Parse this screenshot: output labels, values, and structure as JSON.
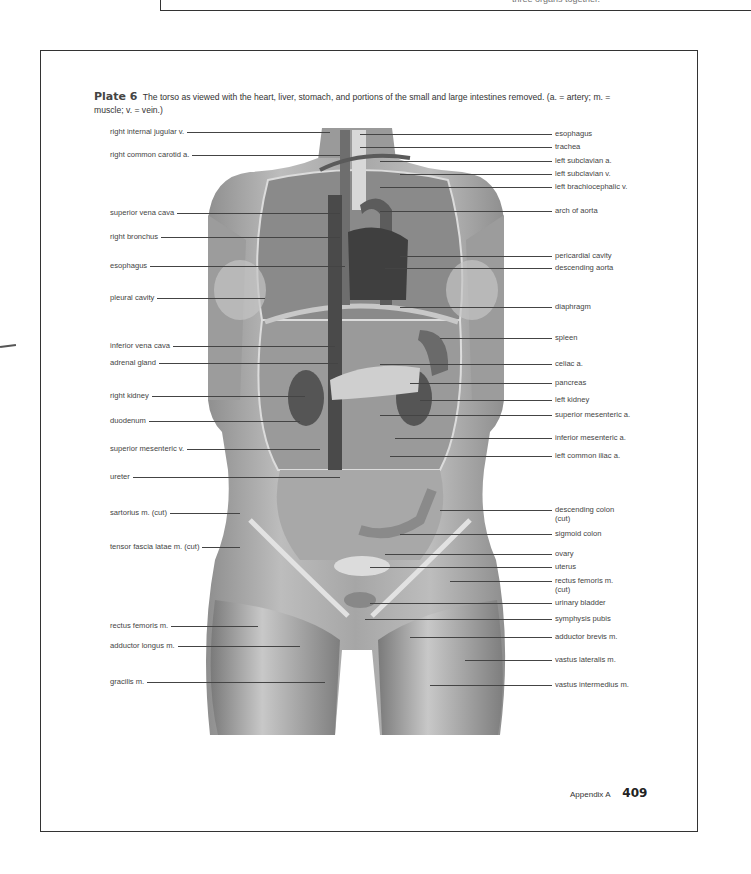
{
  "previous_page_fragment": "three organs together.",
  "plate": {
    "number_label": "Plate 6",
    "caption": "The torso as viewed with the heart, liver, stomach, and portions of the small and large intestines removed. (a. = artery; m. = muscle; v. = vein.)"
  },
  "labels_left": [
    {
      "text": "right internal jugular v."
    },
    {
      "text": "right common carotid a."
    },
    {
      "text": "superior vena cava"
    },
    {
      "text": "right bronchus"
    },
    {
      "text": "esophagus"
    },
    {
      "text": "pleural cavity"
    },
    {
      "text": "inferior vena cava"
    },
    {
      "text": "adrenal gland"
    },
    {
      "text": "right kidney"
    },
    {
      "text": "duodenum"
    },
    {
      "text": "superior mesenteric v."
    },
    {
      "text": "ureter"
    },
    {
      "text": "sartorius m. (cut)"
    },
    {
      "text": "tensor fascia latae m. (cut)"
    },
    {
      "text": "rectus femoris m."
    },
    {
      "text": "adductor longus m."
    },
    {
      "text": "gracilis m."
    }
  ],
  "labels_right": [
    {
      "text": "esophagus"
    },
    {
      "text": "trachea"
    },
    {
      "text": "left subclavian a."
    },
    {
      "text": "left subclavian v."
    },
    {
      "text": "left brachiocephalic v."
    },
    {
      "text": "arch of aorta"
    },
    {
      "text": "pericardial cavity"
    },
    {
      "text": "descending aorta"
    },
    {
      "text": "diaphragm"
    },
    {
      "text": "spleen"
    },
    {
      "text": "celiac a."
    },
    {
      "text": "pancreas"
    },
    {
      "text": "left kidney"
    },
    {
      "text": "superior mesenteric a."
    },
    {
      "text": "inferior mesenteric a."
    },
    {
      "text": "left common iliac a."
    },
    {
      "text": "descending colon (cut)"
    },
    {
      "text": "sigmoid colon"
    },
    {
      "text": "ovary"
    },
    {
      "text": "uterus"
    },
    {
      "text": "rectus femoris m. (cut)"
    },
    {
      "text": "urinary bladder"
    },
    {
      "text": "symphysis pubis"
    },
    {
      "text": "adductor brevis m."
    },
    {
      "text": "vastus lateralis m."
    },
    {
      "text": "vastus intermedius m."
    }
  ],
  "footer": {
    "section": "Appendix A",
    "page_number": "409"
  }
}
